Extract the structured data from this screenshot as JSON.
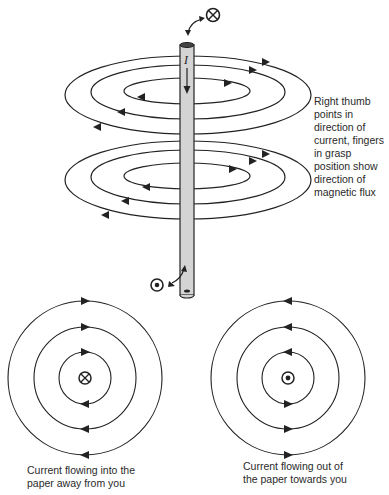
{
  "figure": {
    "rod_label": "I",
    "top_symbol": "into-page (⊗)",
    "bottom_symbol": "out-of-page (⊙)",
    "annotation": {
      "lines": [
        "Right thumb",
        "points in",
        "direction of",
        "current, fingers",
        "in grasp",
        "position show",
        "direction of",
        "magnetic flux"
      ]
    },
    "left_panel": {
      "symbol": "into-page (⊗)",
      "caption_lines": [
        "Current flowing into the",
        "paper away from you"
      ]
    },
    "right_panel": {
      "symbol": "out-of-page (⊙)",
      "caption_lines": [
        "Current flowing out of",
        "the paper towards you"
      ]
    },
    "colors": {
      "line": "#222222",
      "rod_fill": "#d4d4d4",
      "background": "#ffffff"
    }
  }
}
